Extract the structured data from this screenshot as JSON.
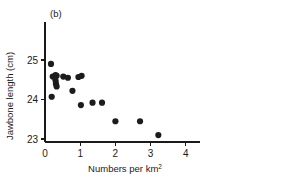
{
  "chart_data": {
    "type": "scatter",
    "title": "",
    "panel_label": "(b)",
    "xlabel": "Numbers per km2",
    "xlabel_base": "Numbers per km",
    "xlabel_exponent": "2",
    "ylabel": "Jawbone length (cm)",
    "xlim": [
      0,
      4.4
    ],
    "ylim": [
      22.85,
      25.35
    ],
    "xticks": [
      0,
      1,
      2,
      3,
      4
    ],
    "xtick_labels": [
      "0",
      "1",
      "2",
      "3",
      "4"
    ],
    "yticks": [
      23,
      24,
      25
    ],
    "ytick_labels": [
      "23",
      "24",
      "25"
    ],
    "grid": false,
    "legend": false,
    "marker_color": "#1c1c1c",
    "marker_size": 3.1,
    "axis_color": "#1a1a1a",
    "points": [
      {
        "x": 0.17,
        "y": 24.9
      },
      {
        "x": 0.22,
        "y": 24.58
      },
      {
        "x": 0.3,
        "y": 24.62
      },
      {
        "x": 0.33,
        "y": 24.6
      },
      {
        "x": 0.3,
        "y": 24.48
      },
      {
        "x": 0.31,
        "y": 24.4
      },
      {
        "x": 0.33,
        "y": 24.33
      },
      {
        "x": 0.19,
        "y": 24.07
      },
      {
        "x": 0.52,
        "y": 24.58
      },
      {
        "x": 0.65,
        "y": 24.55
      },
      {
        "x": 0.78,
        "y": 24.22
      },
      {
        "x": 0.95,
        "y": 24.57
      },
      {
        "x": 1.04,
        "y": 24.6
      },
      {
        "x": 1.02,
        "y": 23.86
      },
      {
        "x": 1.35,
        "y": 23.92
      },
      {
        "x": 1.62,
        "y": 23.92
      },
      {
        "x": 2.0,
        "y": 23.45
      },
      {
        "x": 2.7,
        "y": 23.45
      },
      {
        "x": 3.22,
        "y": 23.1
      }
    ]
  },
  "figure": {
    "panel_label": "(b)",
    "background": "#ffffff"
  }
}
